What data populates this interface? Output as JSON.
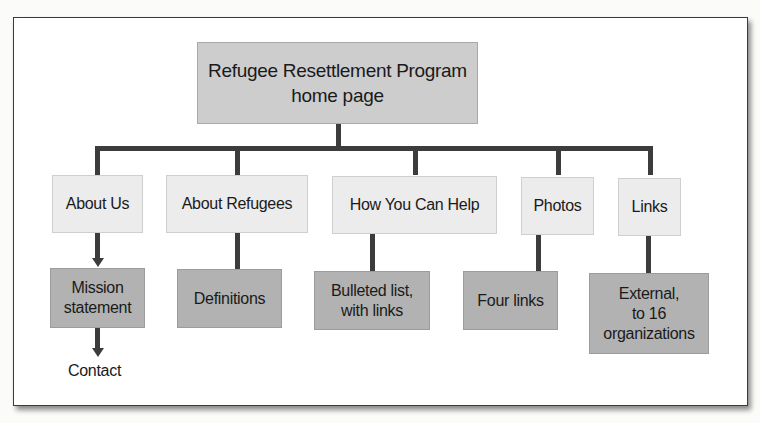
{
  "diagram": {
    "type": "site-map",
    "root": {
      "label": "Refugee Resettlement Program\nhome page",
      "line1": "Refugee Resettlement Program",
      "line2": "home page"
    },
    "sections": [
      {
        "label": "About Us",
        "child": {
          "line1": "Mission",
          "line2": "statement"
        },
        "grandchild": "Contact"
      },
      {
        "label": "About Refugees",
        "child": {
          "line1": "Definitions"
        }
      },
      {
        "label": "How You Can Help",
        "child": {
          "line1": "Bulleted list,",
          "line2": "with links"
        }
      },
      {
        "label": "Photos",
        "child": {
          "line1": "Four links"
        }
      },
      {
        "label": "Links",
        "child": {
          "line1": "External,",
          "line2": "to 16",
          "line3": "organizations"
        }
      }
    ],
    "colors": {
      "root_fill": "#cdcdcd",
      "section_fill": "#ececec",
      "subpage_fill": "#b2b2b2",
      "connector": "#3c3c3c"
    }
  }
}
